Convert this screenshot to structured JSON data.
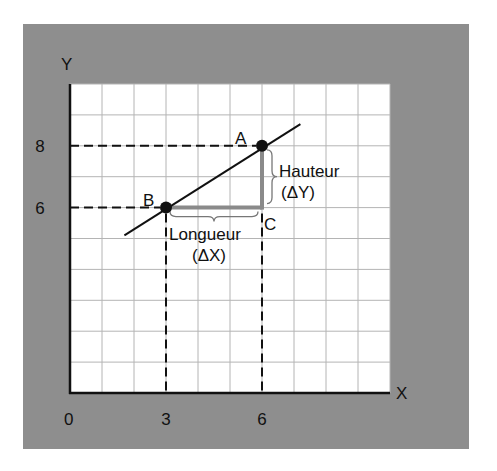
{
  "diagram": {
    "axes": {
      "x_label": "X",
      "y_label": "Y",
      "origin_label": "0",
      "x_range": [
        0,
        10
      ],
      "y_range": [
        0,
        10
      ],
      "x_ticks": [
        "3",
        "6"
      ],
      "x_tick_values": [
        3,
        6
      ],
      "y_ticks": [
        "8",
        "6"
      ],
      "y_tick_values": [
        8,
        6
      ]
    },
    "grid": {
      "enabled": true,
      "x_lines": 10,
      "y_lines": 10
    },
    "line": {
      "from": [
        1.7,
        5.1
      ],
      "to": [
        7.2,
        8.7
      ]
    },
    "points": [
      {
        "label": "A",
        "x": 6,
        "y": 8
      },
      {
        "label": "B",
        "x": 3,
        "y": 6
      },
      {
        "label": "C",
        "x": 6,
        "y": 6
      }
    ],
    "annotations": {
      "run_label": "Longueur",
      "run_sub": "(ΔX)",
      "rise_label": "Hauteur",
      "rise_sub": "(ΔY)"
    },
    "colors": {
      "panel": "#8e8e8e",
      "grid": "#b4b4b4",
      "triangle": "#8a8a8a",
      "ink": "#111111"
    }
  }
}
